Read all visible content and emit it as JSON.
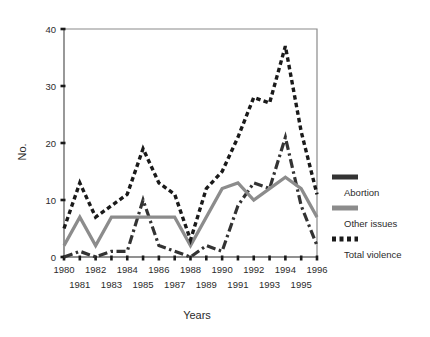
{
  "chart_data": {
    "type": "line",
    "title": "",
    "xlabel": "Years",
    "ylabel": "No.",
    "xlim": [
      1980,
      1996
    ],
    "ylim": [
      0,
      40
    ],
    "yticks": [
      0,
      10,
      20,
      30,
      40
    ],
    "grid": false,
    "legend_position": "right",
    "x": [
      1980,
      1981,
      1982,
      1983,
      1984,
      1985,
      1986,
      1987,
      1988,
      1989,
      1990,
      1991,
      1992,
      1993,
      1994,
      1995,
      1996
    ],
    "xtick_labels_upper": [
      "1980",
      "1982",
      "1984",
      "1986",
      "1988",
      "1990",
      "1992",
      "1994",
      "1996"
    ],
    "xtick_labels_lower": [
      "1981",
      "1983",
      "1985",
      "1987",
      "1989",
      "1991",
      "1993",
      "1995"
    ],
    "series": [
      {
        "name": "Abortion",
        "color": "#333333",
        "style": "dash-dot",
        "values": [
          0,
          1,
          0,
          1,
          1,
          10,
          2,
          1,
          0,
          2,
          1,
          9,
          13,
          12,
          21,
          9,
          2
        ]
      },
      {
        "name": "Other issues",
        "color": "#8c8c8c",
        "style": "solid",
        "values": [
          2,
          7,
          2,
          7,
          7,
          7,
          7,
          7,
          2,
          7,
          12,
          13,
          10,
          12,
          14,
          12,
          7
        ]
      },
      {
        "name": "Total violence",
        "color": "#1a1a1a",
        "style": "dotted",
        "values": [
          5,
          13,
          7,
          9,
          11,
          19,
          13,
          11,
          3,
          12,
          15,
          21,
          28,
          27,
          37,
          22,
          11
        ]
      }
    ]
  },
  "legend": {
    "items": [
      {
        "label": "Abortion"
      },
      {
        "label": "Other issues"
      },
      {
        "label": "Total violence"
      }
    ]
  }
}
